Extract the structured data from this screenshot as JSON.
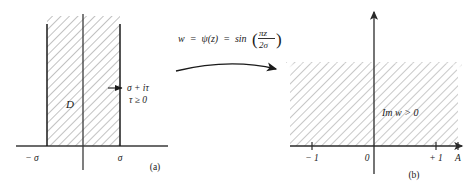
{
  "figure": {
    "type": "conformal-mapping-diagram",
    "panel_a": {
      "caption": "(a)",
      "domain_label": "D",
      "axis_tick_labels": [
        "− σ",
        "σ"
      ],
      "point_label_line1": "σ + iτ",
      "point_label_line2": "τ ≥ 0",
      "shading": "hatched"
    },
    "mapping": {
      "expression_lhs": "w  =  ψ(z)  =  sin",
      "paren_open": "(",
      "paren_close": ")",
      "fraction_numerator": "πz",
      "fraction_denominator": "2σ",
      "arrow": "curved-arrow-right"
    },
    "panel_b": {
      "caption": "(b)",
      "region_label": "Im w > 0",
      "axis_tick_labels": [
        "− 1",
        "0",
        "+ 1",
        "A"
      ],
      "shading": "hatched"
    },
    "colors": {
      "ink": "#1a1a1a",
      "axis": "#3a3a3a",
      "hatch": "#9a9a9a",
      "background": "#ffffff"
    }
  }
}
